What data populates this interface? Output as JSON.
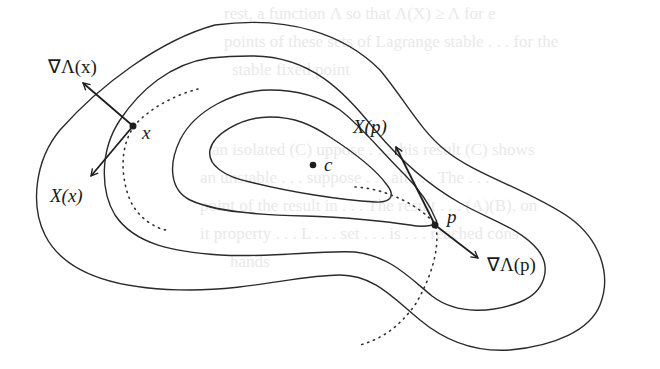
{
  "figure": {
    "type": "level-set contour diagram",
    "labels": {
      "grad_x": "∇Λ(x)",
      "X_x": "X(x)",
      "point_x": "x",
      "point_c": "c",
      "X_p": "X(p)",
      "point_p": "p",
      "grad_p": "∇Λ(p)"
    },
    "points": {
      "x": [
        133,
        126
      ],
      "c": [
        313,
        165
      ],
      "p": [
        435,
        225
      ]
    },
    "contour_count": 4,
    "colors": {
      "ink": "#1e1e1e",
      "background": "#ffffff",
      "bleed_text": "#e9e9e9"
    }
  },
  "bleed_through": {
    "line1": "rest, a function Λ so that Λ(X) ≥ Λ for e",
    "line2": "points of these sets of Lagrange stable . . . for the",
    "line3": "stable fixed point",
    "line4": "an isolated (C) uppose  . . . this result (C) shows",
    "line5": "an unstable . . . suppose . . . all . . . The . . .",
    "line6": "point of the result in . . . The result . . . (A)(B), on",
    "line7": "it property . . . L . . . set . . . is . . . reached cons",
    "line8": "hands"
  }
}
